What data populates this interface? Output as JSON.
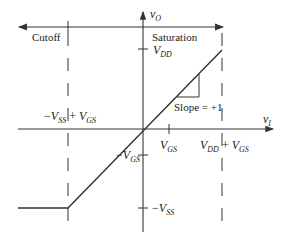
{
  "diagram": {
    "type": "transfer-characteristic",
    "axes": {
      "x_label": "v",
      "x_sub": "I",
      "y_label": "v",
      "y_sub": "O"
    },
    "regions": {
      "cutoff": "Cutoff",
      "saturation": "Saturation"
    },
    "ticks": {
      "vdd": {
        "main": "V",
        "sub": "DD"
      },
      "neg_vgs": {
        "prefix": "−",
        "main": "V",
        "sub": "GS"
      },
      "neg_vss": {
        "prefix": "−",
        "main": "V",
        "sub": "SS"
      },
      "vgs": {
        "main": "V",
        "sub": "GS"
      },
      "left_bound": {
        "prefix": "−",
        "a": "V",
        "a_sub": "SS",
        "op": " + ",
        "b": "V",
        "b_sub": "GS"
      },
      "right_bound": {
        "a": "V",
        "a_sub": "DD",
        "op": " + ",
        "b": "V",
        "b_sub": "GS"
      }
    },
    "slope_label": "Slope = +1",
    "colors": {
      "line": "#333333",
      "text": "#222222"
    }
  }
}
